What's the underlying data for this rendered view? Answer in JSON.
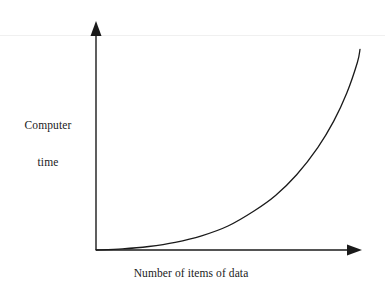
{
  "figure": {
    "name": "computer-time-growth-curve",
    "background_color": "#ffffff",
    "ink_color": "#1a1a1a",
    "scan_line_color": "#f0f0f0"
  },
  "labels": {
    "y_axis_line_1": "Computer",
    "y_axis_line_2": "time",
    "x_axis": "Number of items of data"
  },
  "icons": {
    "y_axis_arrow": "arrow-up-icon",
    "x_axis_arrow": "arrow-right-icon"
  },
  "chart_data": {
    "type": "line",
    "title": "",
    "xlabel": "Number of items of data",
    "ylabel": "Computer time",
    "grid": false,
    "legend": null,
    "axis_ticks": [],
    "tick_labels": [],
    "axis_arrows": {
      "x": "right",
      "y": "up"
    },
    "xlim": [
      0,
      1
    ],
    "ylim": [
      0,
      1
    ],
    "series": [
      {
        "name": "exponential growth",
        "shape": "exponential",
        "stroke": "#1a1a1a",
        "stroke_width": 1.3,
        "x": [
          0.0,
          0.1,
          0.2,
          0.3,
          0.4,
          0.5,
          0.6,
          0.68,
          0.76,
          0.84,
          0.9,
          0.95,
          0.99,
          1.0
        ],
        "y": [
          0.0,
          0.005,
          0.016,
          0.035,
          0.065,
          0.11,
          0.18,
          0.25,
          0.345,
          0.47,
          0.59,
          0.72,
          0.86,
          0.92
        ]
      }
    ],
    "annotations": []
  },
  "geometry": {
    "origin_px": [
      96,
      250
    ],
    "y_axis_top_px": [
      96,
      22
    ],
    "x_axis_right_px": [
      362,
      250
    ],
    "curve_end_px": [
      360,
      68
    ]
  }
}
